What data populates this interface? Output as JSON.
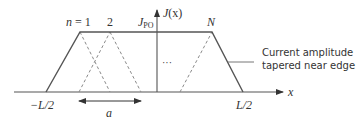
{
  "diagram": {
    "type": "current-distribution",
    "colors": {
      "line": "#555555",
      "dashed": "#8a8a8a",
      "text": "#333333"
    },
    "axes": {
      "x_label": "x",
      "y_label": "J(x)",
      "y_label_main": "J",
      "y_label_arg": "(x)"
    },
    "labels": {
      "n1": "n = 1",
      "n1_var": "n",
      "n1_eq": " = 1",
      "n2": "2",
      "nN": "N",
      "jpo_main": "J",
      "jpo_sub": "PO",
      "dots": "···",
      "left_edge": "−L/2",
      "right_edge": "L/2",
      "spacing": "a"
    },
    "annotation": {
      "line1": "Current amplitude",
      "line2": "tapered near edge"
    }
  }
}
